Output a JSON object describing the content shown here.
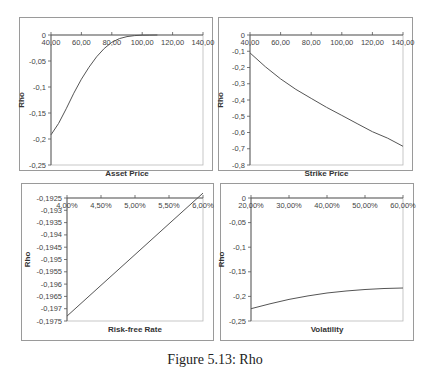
{
  "caption": "Figure 5.13: Rho",
  "chart_data": [
    {
      "type": "line",
      "title": "",
      "xlabel": "Asset Price",
      "ylabel": "Rho",
      "x_ticks": [
        "40,00",
        "60,00",
        "80,00",
        "100,00",
        "120,00",
        "140,00"
      ],
      "y_ticks": [
        "0",
        "-0,05",
        "-0,1",
        "-0,15",
        "-0,2",
        "-0,25"
      ],
      "xlim": [
        40,
        140
      ],
      "ylim": [
        -0.25,
        0
      ],
      "x": [
        40,
        45,
        50,
        55,
        60,
        65,
        70,
        75,
        80,
        85,
        90,
        95,
        100,
        105,
        110
      ],
      "values": [
        -0.192,
        -0.17,
        -0.142,
        -0.112,
        -0.085,
        -0.062,
        -0.042,
        -0.026,
        -0.014,
        -0.007,
        -0.003,
        -0.0012,
        -0.0004,
        -0.0001,
        0.0
      ],
      "grid": false,
      "x_axis_position": "top"
    },
    {
      "type": "line",
      "title": "",
      "xlabel": "Strike Price",
      "ylabel": "Rho",
      "x_ticks": [
        "40,00",
        "60,00",
        "80,00",
        "100,00",
        "120,00",
        "140,00"
      ],
      "y_ticks": [
        "0",
        "-0,1",
        "-0,2",
        "-0,3",
        "-0,4",
        "-0,5",
        "-0,6",
        "-0,7",
        "-0,8"
      ],
      "xlim": [
        40,
        140
      ],
      "ylim": [
        -0.8,
        0
      ],
      "x": [
        40,
        50,
        60,
        70,
        80,
        90,
        100,
        110,
        120,
        130,
        140
      ],
      "values": [
        -0.11,
        -0.195,
        -0.27,
        -0.335,
        -0.39,
        -0.445,
        -0.495,
        -0.545,
        -0.595,
        -0.635,
        -0.685
      ],
      "grid": false,
      "x_axis_position": "top"
    },
    {
      "type": "line",
      "title": "",
      "xlabel": "Risk-free Rate",
      "ylabel": "Rho",
      "x_ticks": [
        "4,00%",
        "4,50%",
        "5,00%",
        "5,50%",
        "6,00%"
      ],
      "y_ticks": [
        "-0,1925",
        "-0,193",
        "-0,1935",
        "-0,194",
        "-0,1945",
        "-0,195",
        "-0,1955",
        "-0,196",
        "-0,1965",
        "-0,197",
        "-0,1975"
      ],
      "xlim": [
        0.04,
        0.06
      ],
      "ylim": [
        -0.1975,
        -0.1925
      ],
      "x": [
        0.04,
        0.045,
        0.05,
        0.055,
        0.06
      ],
      "values": [
        -0.1973,
        -0.19605,
        -0.1948,
        -0.19355,
        -0.1923
      ],
      "grid": false,
      "x_axis_position": "top"
    },
    {
      "type": "line",
      "title": "",
      "xlabel": "Volatility",
      "ylabel": "Rho",
      "x_ticks": [
        "20,00%",
        "30,00%",
        "40,00%",
        "50,00%",
        "60,00%"
      ],
      "y_ticks": [
        "0",
        "-0,05",
        "-0,1",
        "-0,15",
        "-0,2",
        "-0,25"
      ],
      "xlim": [
        0.2,
        0.6
      ],
      "ylim": [
        -0.25,
        0
      ],
      "x": [
        0.2,
        0.25,
        0.3,
        0.35,
        0.4,
        0.45,
        0.5,
        0.55,
        0.6
      ],
      "values": [
        -0.225,
        -0.215,
        -0.206,
        -0.199,
        -0.193,
        -0.189,
        -0.186,
        -0.184,
        -0.183
      ],
      "grid": false,
      "x_axis_position": "top"
    }
  ]
}
